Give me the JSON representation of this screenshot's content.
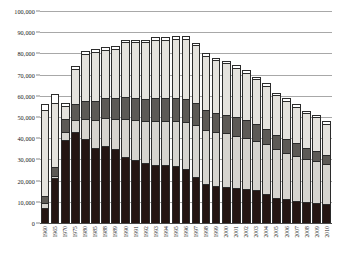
{
  "chart_data": {
    "type": "bar",
    "subtype": "stacked-bar",
    "title": "",
    "xlabel": "",
    "ylabel": "",
    "ylim": [
      0,
      100000
    ],
    "ytick_labels": [
      "100,000",
      "90,000",
      "80,000",
      "70,000",
      "60,000",
      "50,000",
      "40,000",
      "30,000",
      "20,000",
      "10,000",
      "0"
    ],
    "ytick_values": [
      100000,
      90000,
      80000,
      70000,
      60000,
      50000,
      40000,
      30000,
      20000,
      10000,
      0
    ],
    "grid": true,
    "legend_position": "none",
    "categories": [
      "1960",
      "1965",
      "1970",
      "1975",
      "1980",
      "1985",
      "1988",
      "1989",
      "1990",
      "1991",
      "1992",
      "1993",
      "1994",
      "1995",
      "1996",
      "1997",
      "1998",
      "1999",
      "2000",
      "2001",
      "2002",
      "2003",
      "2004",
      "2005",
      "2006",
      "2007",
      "2008",
      "2009",
      "2010"
    ],
    "series": [
      {
        "name": "segment-1",
        "color": "#241512",
        "values": [
          7000,
          21000,
          39000,
          43000,
          39500,
          35500,
          36500,
          35000,
          31000,
          29500,
          28500,
          27500,
          27500,
          27000,
          25500,
          21500,
          18500,
          17500,
          17000,
          16500,
          16000,
          15500,
          13500,
          12000,
          11500,
          10500,
          10000,
          9500,
          9000
        ]
      },
      {
        "name": "segment-2",
        "color": "#d6d4cf",
        "values": [
          2500,
          1500,
          4000,
          6000,
          10000,
          13500,
          13500,
          14500,
          18500,
          19500,
          20000,
          21000,
          21000,
          21500,
          22500,
          25000,
          25500,
          25500,
          25500,
          25000,
          24500,
          23500,
          24000,
          23000,
          22000,
          21500,
          20500,
          20000,
          19000
        ]
      },
      {
        "name": "segment-3",
        "color": "#5d5a56",
        "values": [
          3500,
          4500,
          6500,
          7500,
          8500,
          9000,
          9500,
          10000,
          10500,
          10500,
          10500,
          11000,
          11000,
          11000,
          11000,
          10500,
          10000,
          9500,
          9000,
          9000,
          8500,
          8000,
          7500,
          7000,
          6500,
          6000,
          5500,
          5000,
          4500
        ]
      },
      {
        "name": "segment-4",
        "color": "#e4e2dd",
        "values": [
          41000,
          30500,
          6500,
          17000,
          22500,
          23500,
          23000,
          23500,
          26000,
          26500,
          27000,
          27500,
          27500,
          28000,
          28500,
          27500,
          25500,
          25000,
          24500,
          23500,
          22500,
          21500,
          20500,
          19000,
          18500,
          17500,
          16500,
          16000,
          15000
        ]
      },
      {
        "name": "segment-5",
        "color": "#ffffff",
        "values": [
          3000,
          4500,
          1500,
          1500,
          1500,
          1500,
          1500,
          1500,
          1500,
          1500,
          1500,
          1500,
          1500,
          1500,
          1500,
          1500,
          1500,
          1500,
          1500,
          1500,
          1500,
          1500,
          1500,
          1500,
          1500,
          1500,
          1500,
          1500,
          1500
        ]
      }
    ],
    "totals": [
      57000,
      62000,
      57500,
      75000,
      82000,
      83000,
      84000,
      84500,
      87500,
      87500,
      87500,
      88500,
      88500,
      89000,
      89000,
      86000,
      81000,
      79000,
      77500,
      75500,
      73000,
      70000,
      67000,
      62500,
      60000,
      57000,
      54000,
      52000,
      49000
    ]
  }
}
